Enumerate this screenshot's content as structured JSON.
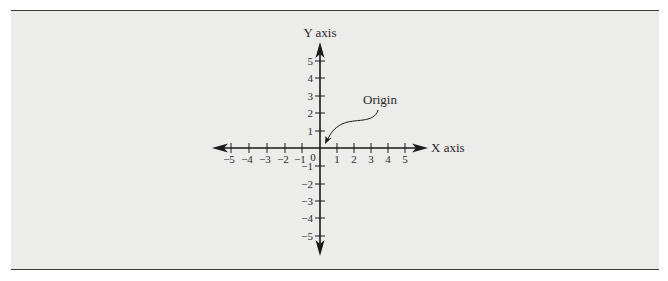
{
  "figure": {
    "x_axis_label": "X axis",
    "y_axis_label": "Y axis",
    "origin_callout": "Origin",
    "origin_label": "0",
    "x_tick_labels": [
      "−5",
      "−4",
      "−3",
      "−2",
      "−1",
      "1",
      "2",
      "3",
      "4",
      "5"
    ],
    "y_tick_labels": [
      "5",
      "4",
      "3",
      "2",
      "1",
      "−1",
      "−2",
      "−3",
      "−4",
      "−5"
    ],
    "colors": {
      "panel_background": "#ececea",
      "rule": "#3a3a3a",
      "axis": "#1a1a1a"
    }
  }
}
